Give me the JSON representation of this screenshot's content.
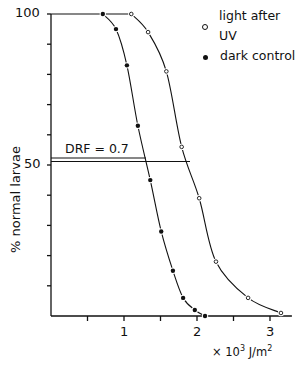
{
  "chart_data": {
    "type": "scatter",
    "title": "",
    "xlabel": "× 10³ J/m²",
    "ylabel": "% normal larvae",
    "xlim": [
      0,
      3.3
    ],
    "ylim": [
      0,
      100
    ],
    "x_ticks": [
      0.5,
      1,
      1.5,
      2,
      2.5,
      3
    ],
    "x_tick_labels": [
      "1",
      "2",
      "3"
    ],
    "y_ticks": [
      10,
      20,
      30,
      40,
      50,
      60,
      70,
      80,
      90,
      100
    ],
    "y_tick_labels": [
      "50",
      "100"
    ],
    "grid": false,
    "legend_position": "top-right",
    "series": [
      {
        "name": "light after UV",
        "marker": "open-circle",
        "x": [
          1.1,
          1.33,
          1.58,
          1.79,
          2.03,
          2.26,
          2.7,
          3.15
        ],
        "y": [
          100,
          94,
          81,
          56,
          39,
          18,
          6,
          1
        ]
      },
      {
        "name": "dark control",
        "marker": "filled-circle",
        "x": [
          0.71,
          0.89,
          1.04,
          1.19,
          1.36,
          1.51,
          1.67,
          1.81,
          1.97,
          2.11
        ],
        "y": [
          100,
          95,
          83,
          63,
          45,
          28,
          15,
          6,
          2,
          0
        ]
      }
    ],
    "annotations": [
      {
        "text": "DRF = 0.7",
        "note": "horizontal lines at ~50% to dark curve (~1.3) and light curve (~1.87)"
      }
    ]
  },
  "labels": {
    "y_100": "100",
    "y_50": "50",
    "x_1": "1",
    "x_2": "2",
    "x_3": "3",
    "ylabel": "% normal larvae",
    "unit_prefix": "× 10",
    "unit_exp": "3",
    "unit_mid": " J/m",
    "unit_exp2": "2",
    "drf": "DRF = 0.7",
    "legend_light": "light after UV",
    "legend_dark": "dark control"
  }
}
